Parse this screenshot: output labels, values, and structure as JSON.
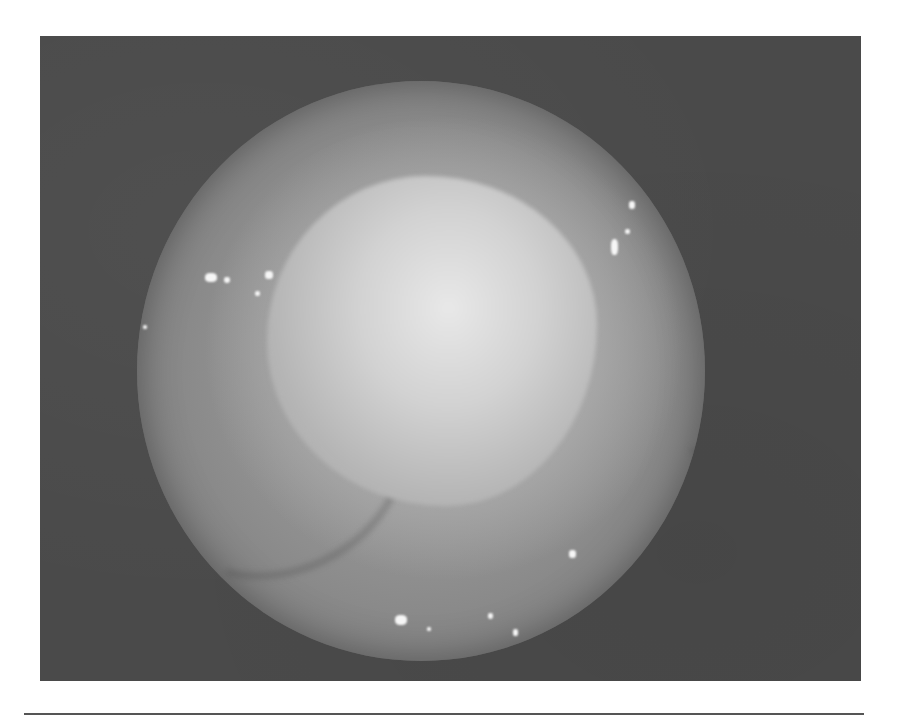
{
  "figure": {
    "type": "endoscopic-photograph",
    "colors": {
      "background": "#ffffff",
      "frame": "#4a4a4a",
      "scope_field": "#9d9d9d",
      "highlight": "#f6f6f6",
      "rule": "#555555"
    }
  }
}
